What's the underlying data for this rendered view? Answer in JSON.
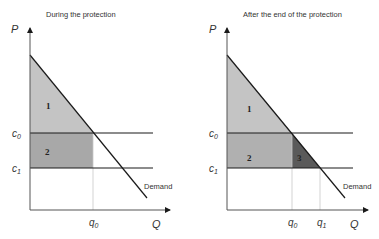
{
  "left_panel": {
    "title": "During the protection",
    "y_axis": "P",
    "x_axis": "Q",
    "c0": "c",
    "c0_sub": "0",
    "c1": "c",
    "c1_sub": "1",
    "q0": "q",
    "q0_sub": "0",
    "regions": [
      "1",
      "2"
    ],
    "demand_label": "Demand"
  },
  "right_panel": {
    "title": "After the end of the protection",
    "y_axis": "P",
    "x_axis": "Q",
    "c0": "c",
    "c0_sub": "0",
    "c1": "c",
    "c1_sub": "1",
    "q0": "q",
    "q0_sub": "0",
    "q1": "q",
    "q1_sub": "1",
    "regions": [
      "1",
      "2",
      "3"
    ],
    "demand_label": "Demand"
  },
  "colors": {
    "light_fill": "#c4c4c4",
    "mid_fill": "#a8a8a8",
    "dark_fill": "#5a5a5a",
    "line": "#1a1a1a"
  }
}
